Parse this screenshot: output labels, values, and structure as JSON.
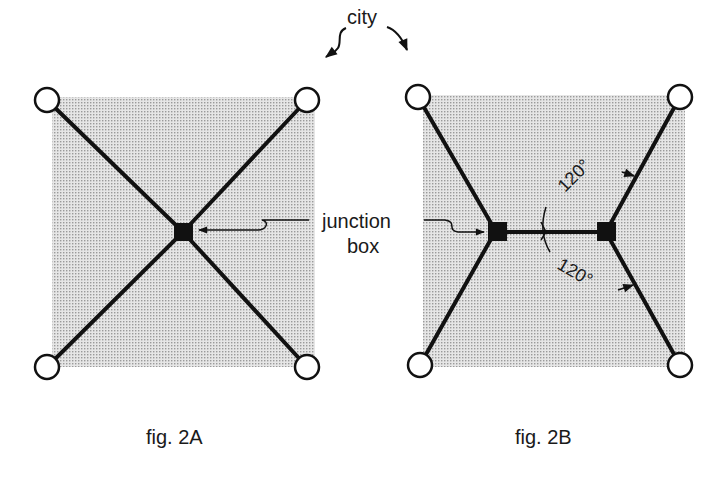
{
  "labels": {
    "city": "city",
    "junction_line1": "junction",
    "junction_line2": "box",
    "angle_top": "120°",
    "angle_bottom": "120°",
    "fig_a_caption": "fig. 2A",
    "fig_b_caption": "fig. 2B"
  },
  "colors": {
    "background": "#ffffff",
    "square_fill": "#dcdcdc",
    "line": "#111111",
    "city_fill": "#ffffff"
  },
  "figures": [
    {
      "id": "fig-2A",
      "caption": "fig. 2A",
      "cities": 4,
      "junction_boxes": 1,
      "topology": "X (all four cities connected to single central junction box)"
    },
    {
      "id": "fig-2B",
      "caption": "fig. 2B",
      "cities": 4,
      "junction_boxes": 2,
      "topology": "Steiner tree: two junction boxes joined by a horizontal segment, each meeting two cities at 120° angles",
      "angles": [
        "120°",
        "120°"
      ]
    }
  ]
}
